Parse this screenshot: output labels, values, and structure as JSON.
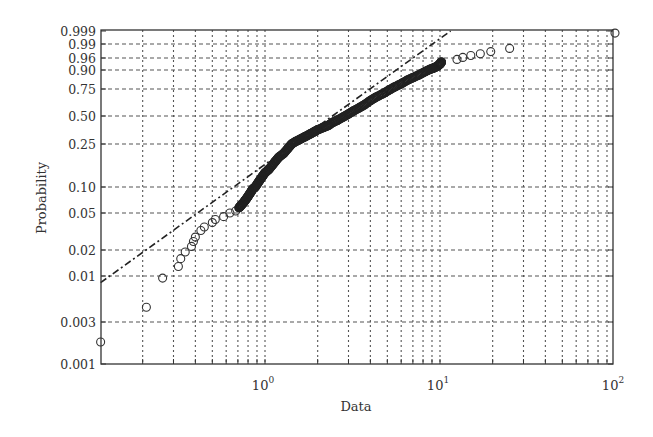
{
  "chart_data": {
    "type": "scatter",
    "subtype": "lognormal probability plot",
    "title": "",
    "xlabel": "Data",
    "ylabel": "Probability",
    "xscale": "log",
    "xlim": [
      0.115,
      100
    ],
    "ylim": [
      0.001,
      0.999
    ],
    "grid": true,
    "legend": null,
    "x_ticks": [
      {
        "value": 1,
        "label_base": "10",
        "label_exp": "0"
      },
      {
        "value": 10,
        "label_base": "10",
        "label_exp": "1"
      },
      {
        "value": 100,
        "label_base": "10",
        "label_exp": "2"
      }
    ],
    "x_minor_grid": [
      0.2,
      0.3,
      0.4,
      0.5,
      0.6,
      0.7,
      0.8,
      0.9,
      2,
      3,
      4,
      5,
      6,
      7,
      8,
      9,
      20,
      30,
      40,
      50,
      60,
      70,
      80,
      90
    ],
    "y_ticks": [
      {
        "value": 0.999,
        "label": "0.999"
      },
      {
        "value": 0.99,
        "label": "0.99"
      },
      {
        "value": 0.96,
        "label": "0.96"
      },
      {
        "value": 0.9,
        "label": "0.90"
      },
      {
        "value": 0.75,
        "label": "0.75"
      },
      {
        "value": 0.5,
        "label": "0.50"
      },
      {
        "value": 0.25,
        "label": "0.25"
      },
      {
        "value": 0.1,
        "label": "0.10"
      },
      {
        "value": 0.05,
        "label": "0.05"
      },
      {
        "value": 0.02,
        "label": "0.02"
      },
      {
        "value": 0.01,
        "label": "0.01"
      },
      {
        "value": 0.003,
        "label": "0.003"
      },
      {
        "value": 0.001,
        "label": "0.001"
      }
    ],
    "reference_line": {
      "style": "dash-dot",
      "from": {
        "x": 0.115,
        "y": 0.0085
      },
      "to": {
        "x": 11.5,
        "y": 0.999
      }
    },
    "series": [
      {
        "name": "sample",
        "marker": "open-circle",
        "points": [
          [
            0.115,
            0.0018
          ],
          [
            0.21,
            0.0045
          ],
          [
            0.26,
            0.0095
          ],
          [
            0.32,
            0.013
          ],
          [
            0.33,
            0.016
          ],
          [
            0.35,
            0.019
          ],
          [
            0.38,
            0.022
          ],
          [
            0.39,
            0.025
          ],
          [
            0.4,
            0.028
          ],
          [
            0.43,
            0.033
          ],
          [
            0.45,
            0.036
          ],
          [
            0.5,
            0.04
          ],
          [
            0.52,
            0.043
          ],
          [
            0.58,
            0.046
          ],
          [
            0.63,
            0.05
          ],
          [
            0.68,
            0.053
          ],
          [
            0.71,
            0.058
          ],
          [
            0.73,
            0.062
          ],
          [
            0.75,
            0.066
          ],
          [
            0.77,
            0.071
          ],
          [
            0.79,
            0.076
          ],
          [
            0.81,
            0.082
          ],
          [
            0.83,
            0.088
          ],
          [
            0.85,
            0.095
          ],
          [
            0.88,
            0.1
          ],
          [
            0.91,
            0.11
          ],
          [
            0.94,
            0.12
          ],
          [
            0.97,
            0.13
          ],
          [
            1.0,
            0.14
          ],
          [
            1.05,
            0.15
          ],
          [
            1.1,
            0.165
          ],
          [
            1.15,
            0.18
          ],
          [
            1.2,
            0.195
          ],
          [
            1.28,
            0.21
          ],
          [
            1.35,
            0.23
          ],
          [
            1.42,
            0.25
          ],
          [
            1.5,
            0.27
          ],
          [
            1.6,
            0.29
          ],
          [
            1.7,
            0.31
          ],
          [
            1.8,
            0.33
          ],
          [
            1.9,
            0.35
          ],
          [
            2.0,
            0.37
          ],
          [
            2.15,
            0.39
          ],
          [
            2.3,
            0.41
          ],
          [
            2.45,
            0.44
          ],
          [
            2.6,
            0.46
          ],
          [
            2.8,
            0.49
          ],
          [
            3.0,
            0.52
          ],
          [
            3.2,
            0.55
          ],
          [
            3.45,
            0.58
          ],
          [
            3.7,
            0.61
          ],
          [
            4.0,
            0.65
          ],
          [
            4.3,
            0.68
          ],
          [
            4.7,
            0.71
          ],
          [
            5.1,
            0.74
          ],
          [
            5.5,
            0.77
          ],
          [
            6.0,
            0.8
          ],
          [
            6.5,
            0.83
          ],
          [
            7.0,
            0.85
          ],
          [
            7.6,
            0.87
          ],
          [
            8.2,
            0.89
          ],
          [
            8.8,
            0.905
          ],
          [
            9.3,
            0.915
          ],
          [
            9.7,
            0.925
          ],
          [
            10.0,
            0.935
          ],
          [
            10.1,
            0.94
          ],
          [
            10.2,
            0.945
          ],
          [
            12.5,
            0.955
          ],
          [
            13.5,
            0.962
          ],
          [
            15.0,
            0.968
          ],
          [
            17.0,
            0.973
          ],
          [
            19.5,
            0.978
          ],
          [
            25.0,
            0.984
          ],
          [
            100.0,
            0.9985
          ]
        ]
      }
    ]
  }
}
